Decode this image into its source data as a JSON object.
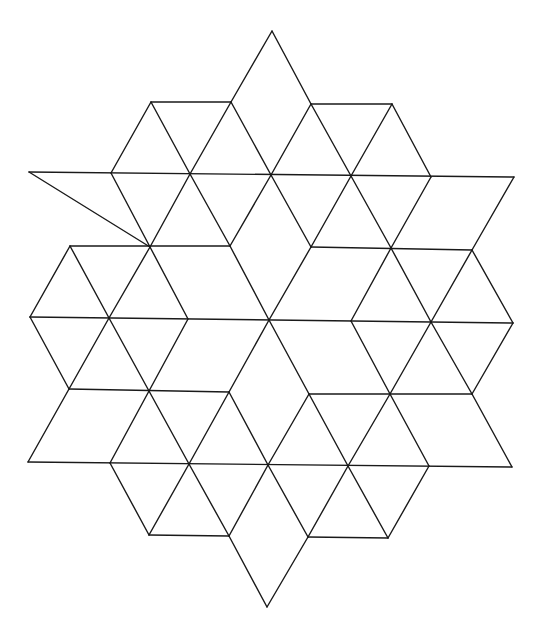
{
  "diagram": {
    "stroke_color": "#1a1a1a",
    "background_color": "#ffffff",
    "vertices": {
      "A": [
        272,
        31
      ],
      "B1": [
        151,
        102
      ],
      "B2": [
        231,
        102
      ],
      "B3": [
        311,
        104
      ],
      "B4": [
        392,
        104
      ],
      "C0": [
        29,
        172
      ],
      "C1": [
        111,
        173
      ],
      "C2": [
        190,
        174
      ],
      "C3": [
        271,
        175
      ],
      "C4": [
        351,
        176
      ],
      "C5": [
        431,
        177
      ],
      "C6": [
        514,
        177
      ],
      "D1": [
        70,
        246
      ],
      "D2": [
        150,
        247
      ],
      "D3": [
        230,
        246
      ],
      "D4": [
        311,
        247
      ],
      "D5": [
        391,
        248
      ],
      "D6": [
        472,
        250
      ],
      "E0": [
        30,
        317
      ],
      "E1": [
        109,
        318
      ],
      "E2": [
        188,
        319
      ],
      "E3": [
        269,
        320
      ],
      "E4": [
        351,
        321
      ],
      "E5": [
        431,
        322
      ],
      "E6": [
        513,
        323
      ],
      "F1": [
        69,
        389
      ],
      "F2": [
        149,
        391
      ],
      "F3": [
        229,
        392
      ],
      "F4": [
        309,
        394
      ],
      "F5": [
        390,
        394
      ],
      "F6": [
        472,
        394
      ],
      "G0": [
        28,
        462
      ],
      "G1": [
        110,
        463
      ],
      "G2": [
        189,
        464
      ],
      "G3": [
        268,
        465
      ],
      "G4": [
        348,
        466
      ],
      "G5": [
        429,
        466
      ],
      "G6": [
        512,
        467
      ],
      "H1": [
        149,
        535
      ],
      "H2": [
        229,
        536
      ],
      "H3": [
        308,
        537
      ],
      "H4": [
        388,
        538
      ],
      "I": [
        267,
        607
      ]
    },
    "edges": [
      [
        "A",
        "B2"
      ],
      [
        "A",
        "B3"
      ],
      [
        "B1",
        "B2"
      ],
      [
        "B3",
        "B4"
      ],
      [
        "B1",
        "C1"
      ],
      [
        "B1",
        "C2"
      ],
      [
        "B2",
        "C2"
      ],
      [
        "B2",
        "C3"
      ],
      [
        "B3",
        "C3"
      ],
      [
        "B3",
        "C4"
      ],
      [
        "B4",
        "C4"
      ],
      [
        "B4",
        "C5"
      ],
      [
        "C0",
        "C6"
      ],
      [
        "C0",
        "D2"
      ],
      [
        "C1",
        "D2"
      ],
      [
        "C2",
        "D2"
      ],
      [
        "C2",
        "D3"
      ],
      [
        "C3",
        "D3"
      ],
      [
        "C3",
        "D4"
      ],
      [
        "C4",
        "D4"
      ],
      [
        "C4",
        "D5"
      ],
      [
        "C5",
        "D5"
      ],
      [
        "C6",
        "D6"
      ],
      [
        "D1",
        "D3"
      ],
      [
        "D4",
        "D6"
      ],
      [
        "D1",
        "E0"
      ],
      [
        "D1",
        "E1"
      ],
      [
        "D2",
        "E1"
      ],
      [
        "D2",
        "E2"
      ],
      [
        "D3",
        "E3"
      ],
      [
        "D4",
        "E3"
      ],
      [
        "D5",
        "E4"
      ],
      [
        "D5",
        "E5"
      ],
      [
        "D6",
        "E5"
      ],
      [
        "D6",
        "E6"
      ],
      [
        "E0",
        "E6"
      ],
      [
        "E0",
        "F1"
      ],
      [
        "E1",
        "F1"
      ],
      [
        "E1",
        "F2"
      ],
      [
        "E2",
        "F2"
      ],
      [
        "E3",
        "F3"
      ],
      [
        "E3",
        "F4"
      ],
      [
        "E4",
        "F5"
      ],
      [
        "E5",
        "F5"
      ],
      [
        "E5",
        "F6"
      ],
      [
        "E6",
        "F6"
      ],
      [
        "F1",
        "F3"
      ],
      [
        "F4",
        "F6"
      ],
      [
        "F1",
        "G0"
      ],
      [
        "F2",
        "G1"
      ],
      [
        "F2",
        "G2"
      ],
      [
        "F3",
        "G2"
      ],
      [
        "F3",
        "G3"
      ],
      [
        "F4",
        "G3"
      ],
      [
        "F4",
        "G4"
      ],
      [
        "F5",
        "G4"
      ],
      [
        "F5",
        "G5"
      ],
      [
        "F6",
        "G6"
      ],
      [
        "G0",
        "G6"
      ],
      [
        "G1",
        "H1"
      ],
      [
        "G2",
        "H1"
      ],
      [
        "G2",
        "H2"
      ],
      [
        "G3",
        "H2"
      ],
      [
        "G3",
        "H3"
      ],
      [
        "G4",
        "H3"
      ],
      [
        "G4",
        "H4"
      ],
      [
        "G5",
        "H4"
      ],
      [
        "H1",
        "H2"
      ],
      [
        "H3",
        "H4"
      ],
      [
        "H2",
        "I"
      ],
      [
        "H3",
        "I"
      ]
    ]
  }
}
